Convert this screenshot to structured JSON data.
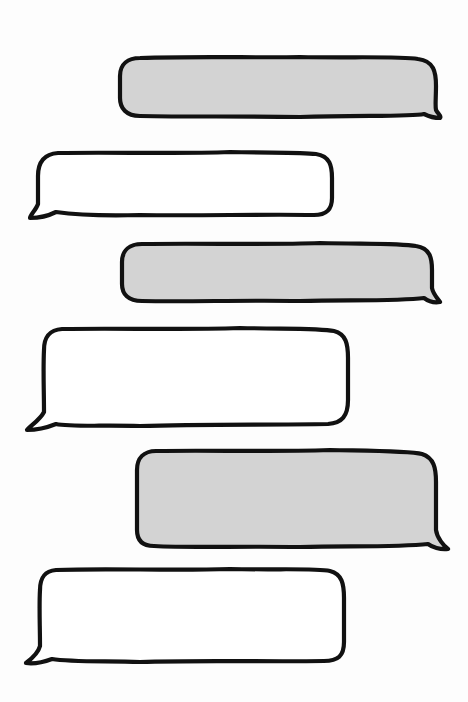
{
  "illustration": {
    "description": "Hand-drawn empty chat speech bubbles",
    "background_color": "#fdfdfd",
    "stroke_color": "#111111",
    "colors": {
      "incoming_fill": "#d3d3d3",
      "outgoing_fill": "#ffffff"
    },
    "bubbles": [
      {
        "index": 1,
        "side": "right",
        "fill": "#d3d3d3",
        "text": ""
      },
      {
        "index": 2,
        "side": "left",
        "fill": "#ffffff",
        "text": ""
      },
      {
        "index": 3,
        "side": "right",
        "fill": "#d3d3d3",
        "text": ""
      },
      {
        "index": 4,
        "side": "left",
        "fill": "#ffffff",
        "text": ""
      },
      {
        "index": 5,
        "side": "right",
        "fill": "#d3d3d3",
        "text": ""
      },
      {
        "index": 6,
        "side": "left",
        "fill": "#ffffff",
        "text": ""
      }
    ]
  }
}
